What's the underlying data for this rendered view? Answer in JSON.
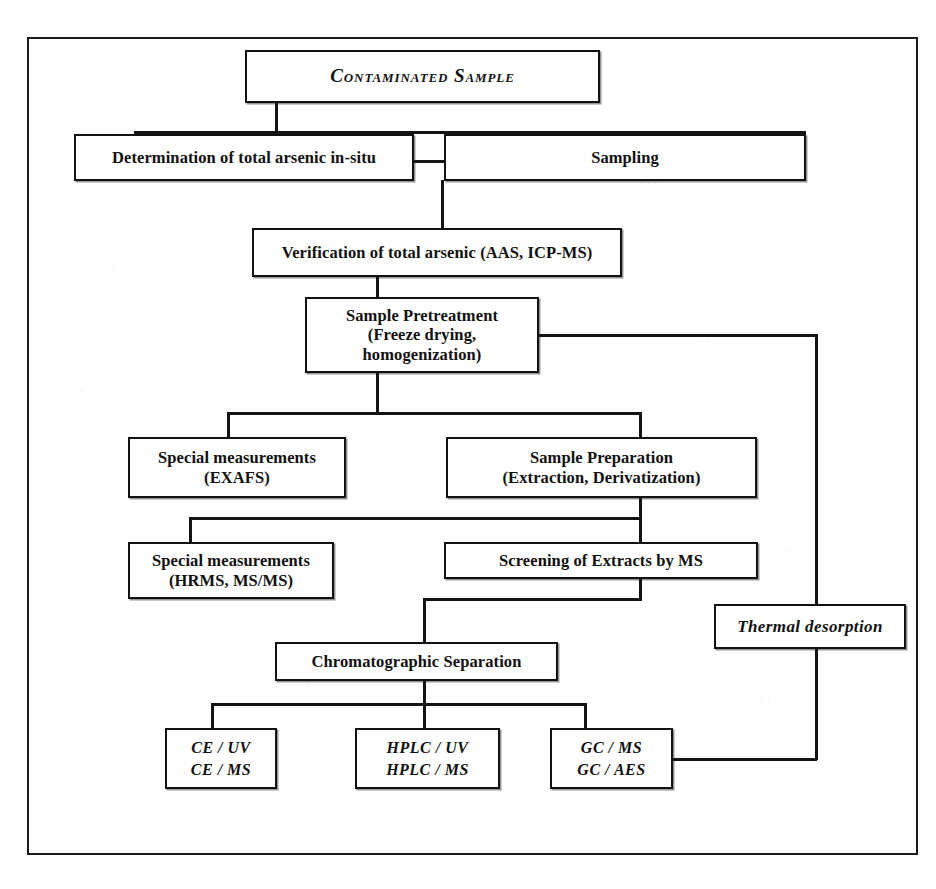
{
  "diagram": {
    "frame_label": "outer-frame",
    "ink_color": "#141414",
    "background_color": "#ffffff"
  },
  "nodes": {
    "contaminated_sample": "Contaminated Sample",
    "determination_in_situ": "Determination of total arsenic in-situ",
    "sampling": "Sampling",
    "verification": "Verification of total arsenic (AAS, ICP-MS)",
    "pretreatment_line1": "Sample Pretreatment",
    "pretreatment_line2": "(Freeze drying,",
    "pretreatment_line3": "homogenization)",
    "special_exafs_line1": "Special measurements",
    "special_exafs_line2": "(EXAFS)",
    "sample_prep_line1": "Sample Preparation",
    "sample_prep_line2": "(Extraction, Derivatization)",
    "special_hrms_line1": "Special measurements",
    "special_hrms_line2": "(HRMS, MS/MS)",
    "screening": "Screening of Extracts by MS",
    "thermal_desorption": "Thermal desorption",
    "chromatographic_separation": "Chromatographic Separation",
    "ce_line1": "CE / UV",
    "ce_line2": "CE / MS",
    "hplc_line1": "HPLC / UV",
    "hplc_line2": "HPLC / MS",
    "gc_line1": "GC / MS",
    "gc_line2": "GC / AES"
  },
  "flow": {
    "edges": [
      "contaminated-sample -> determination-in-situ",
      "contaminated-sample -> sampling",
      "determination-in-situ -> sampling",
      "sampling -> verification",
      "verification -> sample-pretreatment",
      "sample-pretreatment -> special-measurements-exafs",
      "sample-pretreatment -> sample-preparation",
      "sample-pretreatment -> thermal-desorption-bypass",
      "sample-preparation -> special-measurements-hrms",
      "sample-preparation -> screening-of-extracts",
      "screening-of-extracts -> chromatographic-separation",
      "chromatographic-separation -> ce",
      "chromatographic-separation -> hplc",
      "chromatographic-separation -> gc",
      "gc -> thermal-desorption"
    ]
  }
}
